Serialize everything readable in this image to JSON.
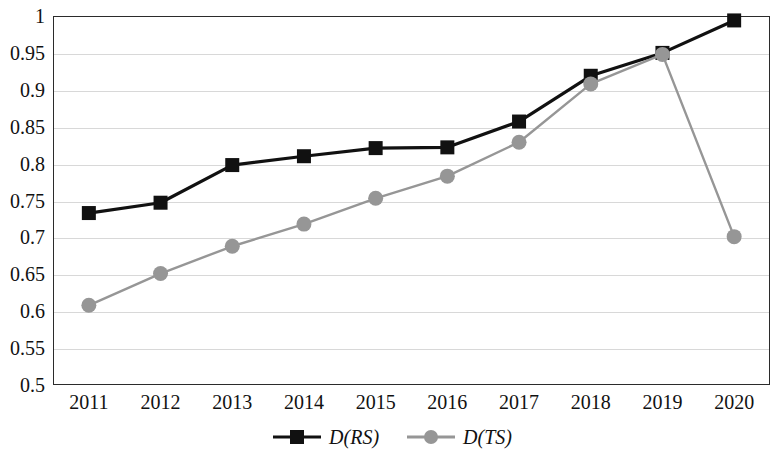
{
  "chart_data": {
    "type": "line",
    "title": "",
    "subtitle": "",
    "xlabel": "",
    "ylabel": "",
    "categories": [
      "2011",
      "2012",
      "2013",
      "2014",
      "2015",
      "2016",
      "2017",
      "2018",
      "2019",
      "2020"
    ],
    "series": [
      {
        "name": "D(RS)",
        "marker": "square",
        "color": "#111111",
        "values": [
          0.733,
          0.747,
          0.798,
          0.81,
          0.821,
          0.822,
          0.857,
          0.919,
          0.95,
          0.994
        ]
      },
      {
        "name": "D(TS)",
        "marker": "circle",
        "color": "#969696",
        "values": [
          0.608,
          0.651,
          0.688,
          0.718,
          0.753,
          0.783,
          0.829,
          0.908,
          0.948,
          0.701
        ]
      }
    ],
    "ylim": [
      0.5,
      1.0
    ],
    "ytick_step": 0.05,
    "ytick_labels": [
      "1",
      "0.95",
      "0.9",
      "0.85",
      "0.8",
      "0.75",
      "0.7",
      "0.65",
      "0.6",
      "0.55",
      "0.5"
    ],
    "ytick_values": [
      1,
      0.95,
      0.9,
      0.85,
      0.8,
      0.75,
      0.7,
      0.65,
      0.6,
      0.55,
      0.5
    ],
    "grid": true,
    "grid_axis": "y",
    "legend_position": "bottom-center",
    "plot_background": "#ffffff",
    "grid_color": "#d8d8d8",
    "axis_color": "#2b2b2b"
  },
  "legend": {
    "items": [
      {
        "label": "D(RS)",
        "marker": "square-marker-icon",
        "color": "#111111"
      },
      {
        "label": "D(TS)",
        "marker": "circle-marker-icon",
        "color": "#969696"
      }
    ]
  }
}
